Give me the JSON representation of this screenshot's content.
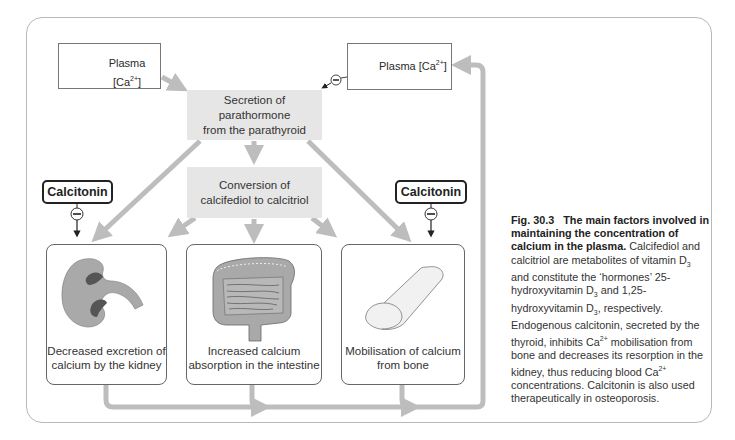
{
  "diagram": {
    "plasma_low": {
      "label": "Plasma [Ca",
      "superscript": "2+",
      "suffix": "]",
      "arrow": "down-arrow-icon"
    },
    "plasma_high": {
      "label": "Plasma [Ca",
      "superscript": "2+",
      "suffix": "]",
      "arrow": "up-arrow-icon"
    },
    "secretion": {
      "line1": "Secretion of parathormone",
      "line2": "from the parathyroid"
    },
    "conversion": {
      "line1": "Conversion of",
      "line2": "calcifediol to calcitriol"
    },
    "calcitonin_left": "Calcitonin",
    "calcitonin_right": "Calcitonin",
    "inhibit_symbol": "−",
    "effects": [
      {
        "icon": "kidney-icon",
        "line1": "Decreased excretion of",
        "line2": "calcium by the kidney"
      },
      {
        "icon": "intestine-icon",
        "line1": "Increased calcium",
        "line2": "absorption in the intestine"
      },
      {
        "icon": "bone-icon",
        "line1": "Mobilisation of calcium",
        "line2": "from bone"
      }
    ],
    "colors": {
      "arrow": "#bdbdbd",
      "box_fill": "#e6e6e6",
      "organ_fill": "#a9a9a9",
      "organ_dark": "#555555"
    }
  },
  "caption": {
    "fig_label": "Fig. 30.3",
    "title": "The main factors involved in maintaining the concentration of calcium in the plasma.",
    "p1": "Calcifediol and calcitriol are metabolites of vitamin D",
    "p1_sub": "3",
    "p2": " and constitute the ‘hormones’ 25-hydroxyvitamin D",
    "p2_sub": "3",
    "p3": " and 1,25-hydroxyvitamin D",
    "p3_sub": "3",
    "p4": ", respectively. Endogenous calcitonin, secreted by the thyroid, inhibits Ca",
    "p4_sup": "2+",
    "p5": " mobilisation from bone and decreases its resorption in the kidney, thus reducing blood Ca",
    "p5_sup": "2+",
    "p6": " concentrations. Calcitonin is also used therapeutically in osteoporosis."
  }
}
